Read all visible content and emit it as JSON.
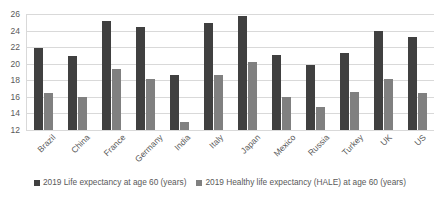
{
  "chart_data": {
    "type": "bar",
    "title": "",
    "xlabel": "",
    "ylabel": "",
    "ylim": [
      12,
      26
    ],
    "ytick_step": 2,
    "yticks": [
      26,
      24,
      22,
      20,
      18,
      16,
      14,
      12
    ],
    "grid": true,
    "legend_position": "bottom",
    "categories": [
      "Brazil",
      "China",
      "France",
      "Germany",
      "India",
      "Italy",
      "Japan",
      "Mexico",
      "Russia",
      "Turkey",
      "UK",
      "US"
    ],
    "series": [
      {
        "name": "2019 Life expectancy at age 60 (years)",
        "color": "#404040",
        "values": [
          21.9,
          20.9,
          25.1,
          24.4,
          18.6,
          24.9,
          25.8,
          21.1,
          19.9,
          21.3,
          24.0,
          23.2
        ]
      },
      {
        "name": "2019 Healthy life expectancy (HALE) at age 60 (years)",
        "color": "#808080",
        "values": [
          16.5,
          16.0,
          19.4,
          18.1,
          13.0,
          18.6,
          20.2,
          16.0,
          14.8,
          16.6,
          18.1,
          16.5
        ]
      }
    ]
  },
  "legend": {
    "items": [
      {
        "label": "2019 Life expectancy at age 60 (years)",
        "swatch": "series-1-swatch"
      },
      {
        "label": "2019 Healthy life expectancy (HALE) at age 60 (years)",
        "swatch": "series-2-swatch"
      }
    ]
  },
  "colors": {
    "series1": "#404040",
    "series2": "#808080",
    "gridline": "#d9d9d9",
    "text": "#595959",
    "background": "#ffffff"
  }
}
